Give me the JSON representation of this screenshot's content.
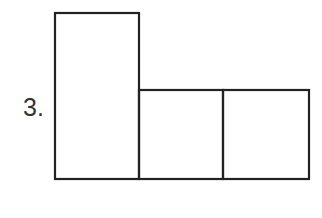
{
  "problem": {
    "number_label": "3."
  },
  "figure": {
    "stroke_color": "#222222",
    "stroke_width": 2.2,
    "shapes": [
      {
        "name": "tall-rectangle",
        "x": 55,
        "y": 13,
        "width": 84,
        "height": 166
      },
      {
        "name": "middle-square",
        "x": 139,
        "y": 90,
        "width": 84,
        "height": 89
      },
      {
        "name": "right-square",
        "x": 223,
        "y": 90,
        "width": 86,
        "height": 89
      }
    ]
  }
}
